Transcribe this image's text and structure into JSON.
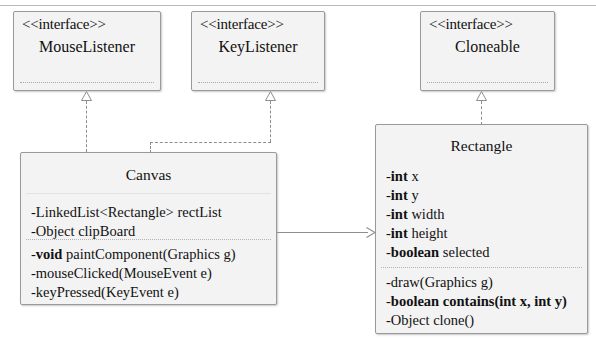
{
  "diagram": {
    "type": "uml-class-diagram",
    "background": "#ffffff",
    "box_fill": "#f3f3f3",
    "box_border": "#9a9a9a",
    "connector_color": "#8e8e8e"
  },
  "interfaces": [
    {
      "id": "mouse-listener",
      "stereotype": "<<interface>>",
      "name": "MouseListener"
    },
    {
      "id": "key-listener",
      "stereotype": "<<interface>>",
      "name": "KeyListener"
    },
    {
      "id": "cloneable",
      "stereotype": "<<interface>>",
      "name": "Cloneable"
    }
  ],
  "classes": {
    "canvas": {
      "name": "Canvas",
      "attributes": [
        {
          "visibility": "-",
          "type": "LinkedList<Rectangle>",
          "type_bold": false,
          "name": "rectList"
        },
        {
          "visibility": "-",
          "type": "Object",
          "type_bold": false,
          "name": "clipBoard"
        }
      ],
      "methods": [
        {
          "visibility": "-",
          "type": "void",
          "type_bold": true,
          "name": "paintComponent(Graphics g)"
        },
        {
          "visibility": "-",
          "type": "",
          "type_bold": false,
          "name": "mouseClicked(MouseEvent e)"
        },
        {
          "visibility": "-",
          "type": "",
          "type_bold": false,
          "name": "keyPressed(KeyEvent e)"
        }
      ]
    },
    "rectangle": {
      "name": "Rectangle",
      "attributes": [
        {
          "visibility": "-",
          "type": "int",
          "type_bold": true,
          "name": "x"
        },
        {
          "visibility": "-",
          "type": "int",
          "type_bold": true,
          "name": "y"
        },
        {
          "visibility": "-",
          "type": "int",
          "type_bold": true,
          "name": "width"
        },
        {
          "visibility": "-",
          "type": "int",
          "type_bold": true,
          "name": "height"
        },
        {
          "visibility": "-",
          "type": "boolean",
          "type_bold": true,
          "name": "selected"
        }
      ],
      "methods": [
        {
          "visibility": "-",
          "type": "",
          "type_bold": false,
          "name": "draw(Graphics g)"
        },
        {
          "visibility": "-",
          "type": "boolean",
          "type_bold": true,
          "name": "contains(int x, int y)",
          "name_bold": true
        },
        {
          "visibility": "-",
          "type": "Object",
          "type_bold": false,
          "name": "clone()"
        }
      ]
    }
  },
  "relationships": [
    {
      "id": "canvas-implements-mouselistener",
      "from": "Canvas",
      "to": "MouseListener",
      "kind": "realization",
      "style": "dashed-hollow-triangle"
    },
    {
      "id": "canvas-implements-keylistener",
      "from": "Canvas",
      "to": "KeyListener",
      "kind": "realization",
      "style": "dashed-hollow-triangle"
    },
    {
      "id": "rectangle-implements-cloneable",
      "from": "Rectangle",
      "to": "Cloneable",
      "kind": "realization",
      "style": "dashed-hollow-triangle"
    },
    {
      "id": "canvas-uses-rectangle",
      "from": "Canvas",
      "to": "Rectangle",
      "kind": "association",
      "style": "solid-open-arrow"
    }
  ]
}
